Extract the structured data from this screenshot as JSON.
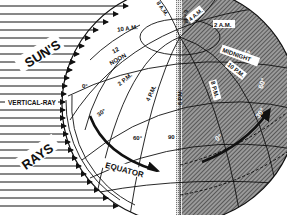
{
  "figure": {
    "colors": {
      "ink": "#111111",
      "background": "#ffffff",
      "night_shade": "#7a7a7a"
    }
  },
  "labels": {
    "suns": "SUN'S",
    "rays": "RAYS",
    "vertical_ray": "VERTICAL-RAY",
    "equator": "EQUATOR"
  },
  "day_times": {
    "t8am": "8 A.M.",
    "t6am": "6 A.M.",
    "t10am": "10 A.M.",
    "t12noon_num": "12",
    "t12noon_word": "NOON",
    "t2pm": "2 P.M.",
    "t4pm": "4 P.M.",
    "t6pm": "6 P.M."
  },
  "night_times": {
    "t4am": "4 A.M.",
    "t2am": "2 A.M.",
    "t12_num": "12",
    "t12_word": "MIDNIGHT",
    "t10pm": "10 P.M.",
    "t8pm": "8 P.M.",
    "lat60": "60°",
    "lat30": "30°"
  },
  "latitudes": {
    "lat0": "0°",
    "lat30": "30°",
    "lat60": "60°",
    "lat90": "90"
  }
}
